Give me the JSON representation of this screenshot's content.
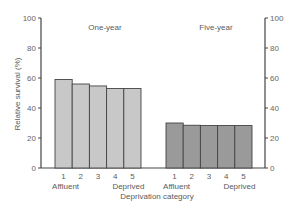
{
  "chart_data": {
    "type": "bar",
    "title": "",
    "ylabel": "Relative survival (%)",
    "xlabel": "Deprivation category",
    "ylim": [
      0,
      100
    ],
    "yticks": [
      0,
      20,
      40,
      60,
      80,
      100
    ],
    "grid": false,
    "legend": null,
    "categories": [
      "1",
      "2",
      "3",
      "4",
      "5"
    ],
    "category_annotations": {
      "1": "Affluent",
      "5": "Deprived"
    },
    "series": [
      {
        "name": "One-year",
        "values": [
          59,
          56,
          54.7,
          53,
          53
        ],
        "color": "#c8c8c8"
      },
      {
        "name": "Five-year",
        "values": [
          30,
          28.5,
          28.3,
          28.3,
          28.3
        ],
        "color": "#9a9a9a"
      }
    ]
  },
  "labels": {
    "ylabel": "Relative survival (%)",
    "xlabel": "Deprivation category",
    "group_one": "One-year",
    "group_five": "Five-year",
    "affluent": "Affluent",
    "deprived": "Deprived"
  },
  "colors": {
    "axis": "#444444",
    "bar_outline": "#444444",
    "one_year_fill": "#c8c8c8",
    "five_year_fill": "#9a9a9a"
  }
}
